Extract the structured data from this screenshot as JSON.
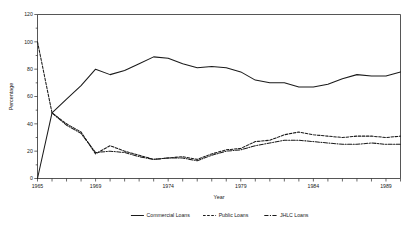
{
  "chart_data": {
    "type": "line",
    "title": "",
    "xlabel": "Year",
    "ylabel": "Percentage",
    "xlim": [
      1965,
      1990
    ],
    "ylim": [
      0,
      120
    ],
    "ytick_values": [
      0,
      20,
      40,
      60,
      80,
      100,
      120
    ],
    "ytick_labels": [
      "0",
      "20",
      "40",
      "60",
      "80",
      "100",
      "120"
    ],
    "xtick_values": [
      1965,
      1966,
      1967,
      1968,
      1969,
      1970,
      1971,
      1972,
      1973,
      1974,
      1975,
      1976,
      1977,
      1978,
      1979,
      1980,
      1981,
      1982,
      1983,
      1984,
      1985,
      1986,
      1987,
      1988,
      1989,
      1990
    ],
    "xtick_labeled": [
      1965,
      1969,
      1974,
      1979,
      1984,
      1989
    ],
    "xtick_labels": [
      "1965",
      "1969",
      "1974",
      "1979",
      "1984",
      "1989"
    ],
    "grid": false,
    "legend_position": "bottom",
    "x": [
      1965,
      1966,
      1967,
      1968,
      1969,
      1970,
      1971,
      1972,
      1973,
      1974,
      1975,
      1976,
      1977,
      1978,
      1979,
      1980,
      1981,
      1982,
      1983,
      1984,
      1985,
      1986,
      1987,
      1988,
      1989,
      1990
    ],
    "series": [
      {
        "name": "Commercial Loans",
        "style": "solid",
        "values": [
          0,
          48,
          58,
          68,
          80,
          76,
          79,
          84,
          89,
          88,
          84,
          81,
          82,
          81,
          78,
          72,
          70,
          70,
          67,
          67,
          69,
          73,
          76,
          75,
          75,
          78
        ]
      },
      {
        "name": "Public Loans",
        "style": "dashed",
        "values": [
          100,
          48,
          40,
          34,
          18,
          24,
          20,
          17,
          14,
          15,
          16,
          14,
          18,
          21,
          22,
          27,
          28,
          32,
          34,
          32,
          31,
          30,
          31,
          31,
          30,
          31
        ]
      },
      {
        "name": "JHLC Loans",
        "style": "dashdot",
        "values": [
          null,
          48,
          39,
          33,
          19,
          20,
          19,
          16,
          14,
          15,
          15,
          13,
          17,
          20,
          21,
          24,
          26,
          28,
          28,
          27,
          26,
          25,
          25,
          26,
          25,
          25
        ]
      }
    ]
  },
  "legend": {
    "items": [
      {
        "label": "Commercial Loans",
        "style": "solid"
      },
      {
        "label": "Public Loans",
        "style": "dashed"
      },
      {
        "label": "JHLC Loans",
        "style": "dashdot"
      }
    ]
  },
  "colors": {
    "line": "#1a1a1a",
    "frame": "#2b2b2b",
    "background": "#ffffff"
  }
}
